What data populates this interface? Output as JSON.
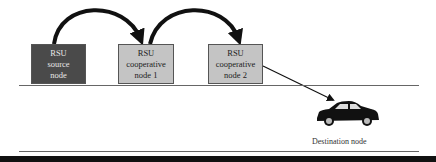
{
  "diagram": {
    "nodes": [
      {
        "id": "source",
        "label": "RSU\nsource\nnode",
        "fill": "#4a4a4a",
        "text_color": "#e8e8e8"
      },
      {
        "id": "coop1",
        "label": "RSU\ncooperative\nnode 1",
        "fill": "#c4c4c4",
        "text_color": "#222222"
      },
      {
        "id": "coop2",
        "label": "RSU\ncooperative\nnode 2",
        "fill": "#c4c4c4",
        "text_color": "#222222"
      }
    ],
    "destination": {
      "label": "Destination node",
      "icon": "car-icon"
    },
    "edges": [
      {
        "from": "source",
        "to": "coop1",
        "style": "thick-curved-arrow"
      },
      {
        "from": "coop1",
        "to": "coop2",
        "style": "thick-curved-arrow"
      },
      {
        "from": "coop2",
        "to": "destination",
        "style": "thin-straight-arrow"
      }
    ]
  }
}
